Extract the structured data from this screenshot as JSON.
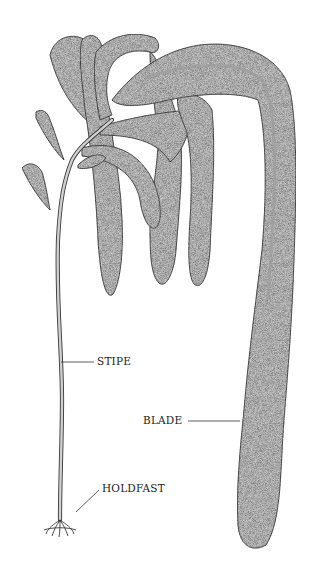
{
  "diagram": {
    "colors": {
      "blade_fill": "#c4c4c4",
      "outline": "#3a3a3a",
      "midrib": "#a8a8a8",
      "background": "#ffffff"
    },
    "labels": {
      "stipe": "STIPE",
      "blade": "BLADE",
      "holdfast": "HOLDFAST"
    }
  }
}
